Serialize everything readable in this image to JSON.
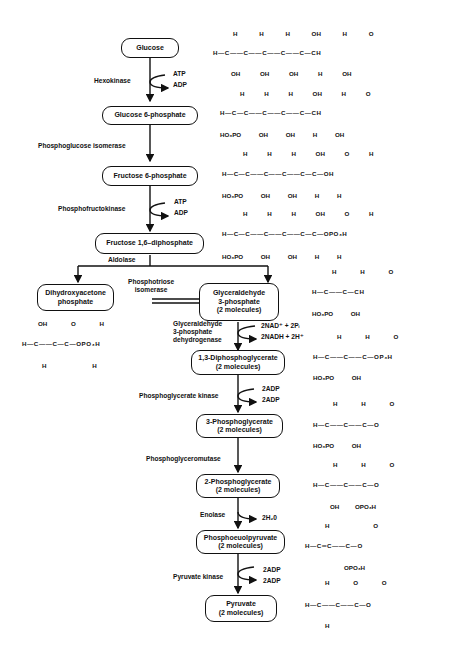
{
  "pathway": {
    "nodes": [
      {
        "id": "glucose",
        "label": "Glucose"
      },
      {
        "id": "g6p",
        "label": "Glucose 6-phosphate"
      },
      {
        "id": "f6p",
        "label": "Fructose 6-phosphate"
      },
      {
        "id": "f16dp",
        "label": "Fructose 1,6–diphosphate"
      },
      {
        "id": "dhap",
        "line1": "Dihydroxyacetone",
        "line2": "phosphate"
      },
      {
        "id": "g3p",
        "line1": "Glyceraldehyde",
        "line2": "3-phosphate",
        "line3": "(2 molecules)"
      },
      {
        "id": "dpg13",
        "line1": "1,3-Diphosphoglycerate",
        "line2": "(2 molecules)"
      },
      {
        "id": "pg3",
        "line1": "3-Phosphoglycerate",
        "line2": "(2 molecules)"
      },
      {
        "id": "pg2",
        "line1": "2-Phosphoglycerate",
        "line2": "(2 molecules)"
      },
      {
        "id": "pep",
        "line1": "Phosphoeuolpyruvate",
        "line2": "(2 molecules)"
      },
      {
        "id": "pyruvate",
        "line1": "Pyruvate",
        "line2": "(2 molecules)"
      }
    ],
    "enzymes": {
      "hexokinase": "Hexokinase",
      "pgi": "Phosphoglucose isomerase",
      "pfk": "Phosphofructokinase",
      "aldolase": "Aldolase",
      "tpi_1": "Phosphotriose",
      "tpi_2": "isomerase",
      "gapdh_1": "Glyceraldehyde",
      "gapdh_2": "3-phosphate",
      "gapdh_3": "dehydrogenase",
      "pgk": "Phosphoglycerate kinase",
      "pgm": "Phosphoglyceromutase",
      "enolase": "Enolase",
      "pk": "Pyruvate kinase"
    },
    "cofactors": {
      "hex_in": "ATP",
      "hex_out": "ADP",
      "pfk_in": "ATP",
      "pfk_out": "ADP",
      "gapdh_in": "2NAD⁺ + 2Pᵢ",
      "gapdh_out": "2NADH + 2H⁺",
      "pgk_in": "2ADP",
      "pgk_out": "2ADP",
      "enolase_out": "2H₂0",
      "pk_in": "2ADP",
      "pk_out": "2ADP"
    }
  },
  "structures": {
    "glucose": {
      "top": [
        "H",
        "H",
        "H",
        "OH",
        "H",
        "O"
      ],
      "main": "H—C——C——C——C——C—CH",
      "bottom": [
        "OH",
        "OH",
        "OH",
        "H",
        "OH"
      ]
    },
    "g6p": {
      "top": [
        "H",
        "H",
        "H",
        "OH",
        "H",
        "O"
      ],
      "main": "H—C—C——C——C——C—CH",
      "bottom": [
        "HO₃PO",
        "OH",
        "OH",
        "H",
        "OH"
      ]
    },
    "f6p": {
      "top": [
        "H",
        "H",
        "H",
        "OH",
        "O",
        "H"
      ],
      "main": "H—C—C——C——C——C—C—OH",
      "bottom": [
        "HO₃PO",
        "OH",
        "OH",
        "H",
        "H"
      ]
    },
    "f16dp": {
      "top": [
        "H",
        "H",
        "H",
        "OH",
        "O",
        "H"
      ],
      "main": "H—C—C——C——C——C—C—OPO₃H",
      "bottom": [
        "HO₃PO",
        "OH",
        "OH",
        "H",
        "H"
      ]
    },
    "g3p": {
      "top": [
        "H",
        "H",
        "O"
      ],
      "main": "H—C——C—CH",
      "bottom": [
        "HO₃PO",
        "OH"
      ]
    },
    "dhap": {
      "top": [
        "OH",
        "O",
        "H"
      ],
      "main": "H—C——C—C—OPO₃H",
      "bottom": [
        "H",
        "H"
      ]
    },
    "dpg13": {
      "top": [
        "H",
        "H",
        "O"
      ],
      "main": "H—C——C——C—OP₃H",
      "bottom": [
        "HO₃PO",
        "OH"
      ]
    },
    "pg3": {
      "top": [
        "H",
        "H",
        "O"
      ],
      "main": "H—C——C——C—O",
      "bottom": [
        "HO₃PO",
        "OH"
      ]
    },
    "pg2": {
      "top": [
        "H",
        "H",
        "O"
      ],
      "main": "H—C——C——C—O",
      "bottom": [
        "OH",
        "OPO₃H"
      ]
    },
    "pep": {
      "top": [
        "H",
        "O"
      ],
      "main": "H—C═C——C—O",
      "bottom": [
        "OPO₃H"
      ]
    },
    "pyruvate": {
      "top": [
        "H",
        "O",
        "O"
      ],
      "main": "H—C——C——C—O",
      "bottom": [
        "H"
      ]
    }
  }
}
